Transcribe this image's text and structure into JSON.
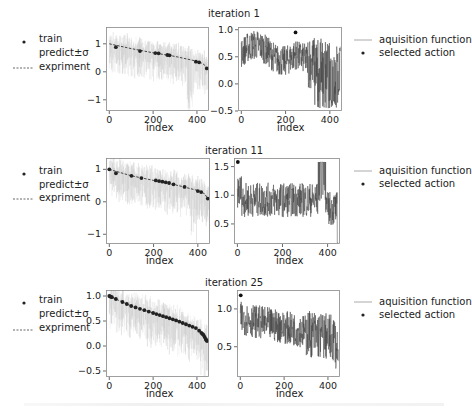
{
  "figure": {
    "rows": [
      {
        "title": "iteration 1",
        "left_legend": {
          "items": [
            {
              "marker": "dot",
              "label": "train"
            },
            {
              "marker": "none",
              "label": "predict±σ"
            },
            {
              "marker": "dashed",
              "label": "expriment"
            }
          ]
        },
        "right_legend": {
          "items": [
            {
              "marker": "line",
              "label": "aquisition function"
            },
            {
              "marker": "dot",
              "label": "selected action"
            }
          ]
        },
        "left_xlabel": "index",
        "right_xlabel": "index"
      },
      {
        "title": "iteration 11",
        "left_legend": {
          "items": [
            {
              "marker": "dot",
              "label": "train"
            },
            {
              "marker": "none",
              "label": "predict±σ"
            },
            {
              "marker": "dashed",
              "label": "expriment"
            }
          ]
        },
        "right_legend": {
          "items": [
            {
              "marker": "line",
              "label": "aquisition function"
            },
            {
              "marker": "dot",
              "label": "selected action"
            }
          ]
        },
        "left_xlabel": "index",
        "right_xlabel": "index"
      },
      {
        "title": "iteration 25",
        "left_legend": {
          "items": [
            {
              "marker": "dot",
              "label": "train"
            },
            {
              "marker": "none",
              "label": "predict±σ"
            },
            {
              "marker": "dashed",
              "label": "expriment"
            }
          ]
        },
        "right_legend": {
          "items": [
            {
              "marker": "line",
              "label": "aquisition function"
            },
            {
              "marker": "dot",
              "label": "selected action"
            }
          ]
        },
        "left_xlabel": "index",
        "right_xlabel": "index"
      }
    ]
  },
  "chart_data": [
    {
      "type": "line",
      "panel": "iteration 1 - model",
      "title": "iteration 1",
      "xlabel": "index",
      "ylabel": "",
      "xlim": [
        -15,
        455
      ],
      "ylim": [
        -1.4,
        1.6
      ],
      "xticks": [
        0,
        200,
        400
      ],
      "yticks": [
        -1,
        0,
        1
      ],
      "yticklabels": [
        "−1",
        "0",
        "1"
      ],
      "series": [
        {
          "name": "expriment",
          "style": "dashed",
          "x": [
            0,
            100,
            200,
            300,
            400,
            430,
            445
          ],
          "values": [
            1.0,
            0.83,
            0.68,
            0.55,
            0.38,
            0.28,
            0.12
          ]
        },
        {
          "name": "train",
          "style": "dot",
          "x": [
            30,
            140,
            210,
            225,
            265,
            275,
            395,
            410,
            445
          ],
          "values": [
            0.88,
            0.74,
            0.67,
            0.66,
            0.6,
            0.59,
            0.36,
            0.34,
            0.12
          ]
        },
        {
          "name": "predict±σ",
          "style": "gray band",
          "note": "wide uncertainty, mostly 0.3–1.3 with dips to -1.2 near index 370"
        }
      ],
      "legend": [
        "train",
        "predict±σ",
        "expriment"
      ],
      "legend_position": "left outside"
    },
    {
      "type": "line",
      "panel": "iteration 1 - acquisition",
      "xlabel": "index",
      "xlim": [
        -15,
        455
      ],
      "ylim": [
        -0.5,
        1.05
      ],
      "xticks": [
        0,
        200,
        400
      ],
      "yticks": [
        -0.5,
        0.0,
        0.5,
        1.0
      ],
      "yticklabels": [
        "−0.5",
        "0.0",
        "0.5",
        "1.0"
      ],
      "series": [
        {
          "name": "aquisition function",
          "style": "line",
          "range_note": "oscillates ~0.3–0.9 for index <250, drops to -0.45 near 330–440"
        },
        {
          "name": "selected action",
          "style": "dot",
          "x": [
            245
          ],
          "values": [
            0.95
          ]
        }
      ],
      "legend": [
        "aquisition function",
        "selected action"
      ],
      "legend_position": "right outside"
    },
    {
      "type": "line",
      "panel": "iteration 11 - model",
      "title": "iteration 11",
      "xlabel": "index",
      "xlim": [
        -15,
        455
      ],
      "ylim": [
        -1.3,
        1.35
      ],
      "xticks": [
        0,
        200,
        400
      ],
      "yticks": [
        -1,
        0,
        1
      ],
      "yticklabels": [
        "−1",
        "0",
        "1"
      ],
      "series": [
        {
          "name": "expriment",
          "style": "dashed",
          "x": [
            0,
            100,
            200,
            300,
            400,
            430,
            445
          ],
          "values": [
            1.0,
            0.8,
            0.66,
            0.52,
            0.35,
            0.25,
            0.1
          ]
        },
        {
          "name": "train",
          "style": "dot",
          "x": [
            0,
            30,
            100,
            145,
            210,
            225,
            240,
            255,
            270,
            290,
            340,
            400,
            415,
            445
          ],
          "values": [
            1.0,
            0.88,
            0.8,
            0.73,
            0.66,
            0.64,
            0.62,
            0.6,
            0.58,
            0.54,
            0.46,
            0.33,
            0.3,
            0.1
          ]
        },
        {
          "name": "predict±σ",
          "style": "gray band",
          "note": "band shrinks near train points; dips to -1.1 near index 380"
        }
      ]
    },
    {
      "type": "line",
      "panel": "iteration 11 - acquisition",
      "xlabel": "index",
      "xlim": [
        -15,
        455
      ],
      "ylim": [
        0.15,
        1.65
      ],
      "xticks": [
        0,
        200,
        400
      ],
      "yticks": [
        0.5,
        1.0,
        1.5
      ],
      "yticklabels": [
        "0.5",
        "1.0",
        "1.5"
      ],
      "series": [
        {
          "name": "aquisition function",
          "style": "line",
          "range_note": "~0.8–1.3, spike block to 1.58 at index 360–390, min ~0.15 at 445"
        },
        {
          "name": "selected action",
          "style": "dot",
          "x": [
            2
          ],
          "values": [
            1.58
          ]
        }
      ]
    },
    {
      "type": "line",
      "panel": "iteration 25 - model",
      "title": "iteration 25",
      "xlabel": "index",
      "xlim": [
        -15,
        455
      ],
      "ylim": [
        -0.62,
        1.12
      ],
      "xticks": [
        0,
        200,
        400
      ],
      "yticks": [
        -0.5,
        0.0,
        0.5,
        1.0
      ],
      "yticklabels": [
        "−0.5",
        "0.0",
        "0.5",
        "1.0"
      ],
      "series": [
        {
          "name": "expriment",
          "style": "dashed",
          "x": [
            0,
            100,
            200,
            300,
            400,
            430,
            445
          ],
          "values": [
            1.0,
            0.8,
            0.66,
            0.52,
            0.35,
            0.22,
            0.1
          ]
        },
        {
          "name": "train",
          "style": "dot",
          "note": "~35 dense training points along the curve from 1.0 to 0.1"
        },
        {
          "name": "predict±σ",
          "style": "gray band",
          "note": "narrower band, dips to ~-0.5 near 430"
        }
      ]
    },
    {
      "type": "line",
      "panel": "iteration 25 - acquisition",
      "xlabel": "index",
      "xlim": [
        -15,
        455
      ],
      "ylim": [
        0.1,
        1.25
      ],
      "xticks": [
        0,
        200,
        400
      ],
      "yticks": [
        0.5,
        1.0
      ],
      "yticklabels": [
        "0.5",
        "1.0"
      ],
      "series": [
        {
          "name": "aquisition function",
          "style": "line",
          "range_note": "~0.7–1.05 decreasing trend, drops to ~0.1 at 440"
        },
        {
          "name": "selected action",
          "style": "dot",
          "x": [
            2
          ],
          "values": [
            1.18
          ]
        }
      ]
    }
  ]
}
